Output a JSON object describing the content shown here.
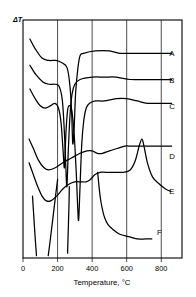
{
  "figure": {
    "type": "thermal-analysis-plot",
    "y_axis_label": "ΔT",
    "x_axis_label": "Temperature, °C",
    "x_ticks": [
      "0",
      "200",
      "400",
      "600",
      "800"
    ],
    "curve_labels": [
      "A",
      "B",
      "C",
      "D",
      "E",
      "F"
    ],
    "line_color": "#000000",
    "background_color": "#ffffff"
  },
  "chart_data": {
    "type": "line",
    "title": "",
    "xlabel": "Temperature, °C",
    "ylabel": "ΔT",
    "xlim": [
      0,
      920
    ],
    "ylim": [
      0,
      100
    ],
    "grid": true,
    "grid_axis": "x",
    "x_ticks": [
      0,
      200,
      400,
      600,
      800
    ],
    "legend": "right-side curve end labels",
    "series": [
      {
        "name": "A",
        "label": "A",
        "label_x": 840,
        "label_y": 86,
        "points": [
          [
            40,
            92
          ],
          [
            70,
            88
          ],
          [
            110,
            84
          ],
          [
            150,
            83
          ],
          [
            190,
            83
          ],
          [
            225,
            82
          ],
          [
            255,
            80
          ],
          [
            272,
            72
          ],
          [
            282,
            60
          ],
          [
            288,
            48
          ],
          [
            296,
            55
          ],
          [
            305,
            70
          ],
          [
            318,
            80
          ],
          [
            330,
            85
          ],
          [
            350,
            86
          ],
          [
            420,
            87
          ],
          [
            500,
            87
          ],
          [
            560,
            86
          ],
          [
            640,
            86
          ],
          [
            720,
            86
          ],
          [
            800,
            86
          ],
          [
            860,
            86
          ]
        ]
      },
      {
        "name": "B",
        "label": "B",
        "label_x": 840,
        "label_y": 75,
        "points": [
          [
            40,
            81
          ],
          [
            75,
            77
          ],
          [
            115,
            74
          ],
          [
            150,
            73
          ],
          [
            185,
            73
          ],
          [
            210,
            72
          ],
          [
            228,
            66
          ],
          [
            240,
            52
          ],
          [
            248,
            38
          ],
          [
            254,
            30
          ],
          [
            262,
            45
          ],
          [
            272,
            60
          ],
          [
            284,
            69
          ],
          [
            300,
            73
          ],
          [
            330,
            75
          ],
          [
            400,
            76
          ],
          [
            470,
            76
          ],
          [
            540,
            76
          ],
          [
            620,
            75
          ],
          [
            700,
            75
          ],
          [
            790,
            75
          ],
          [
            860,
            75
          ]
        ]
      },
      {
        "name": "C",
        "label": "C",
        "label_x": 840,
        "label_y": 64,
        "points": [
          [
            40,
            71
          ],
          [
            70,
            67
          ],
          [
            100,
            64
          ],
          [
            130,
            63
          ],
          [
            160,
            64
          ],
          [
            185,
            65
          ],
          [
            205,
            63
          ],
          [
            220,
            57
          ],
          [
            232,
            45
          ],
          [
            240,
            38
          ],
          [
            248,
            52
          ],
          [
            258,
            62
          ],
          [
            268,
            64
          ],
          [
            282,
            62
          ],
          [
            296,
            52
          ],
          [
            308,
            36
          ],
          [
            316,
            22
          ],
          [
            322,
            16
          ],
          [
            330,
            30
          ],
          [
            340,
            48
          ],
          [
            352,
            58
          ],
          [
            366,
            63
          ],
          [
            385,
            65
          ],
          [
            420,
            66
          ],
          [
            470,
            66
          ],
          [
            540,
            67
          ],
          [
            600,
            67
          ],
          [
            660,
            66
          ],
          [
            720,
            65
          ],
          [
            790,
            65
          ],
          [
            860,
            65
          ]
        ]
      },
      {
        "name": "D",
        "label": "D",
        "label_x": 840,
        "label_y": 43,
        "points": [
          [
            35,
            50
          ],
          [
            60,
            46
          ],
          [
            90,
            41
          ],
          [
            120,
            38
          ],
          [
            150,
            37
          ],
          [
            190,
            38
          ],
          [
            230,
            40
          ],
          [
            280,
            42
          ],
          [
            330,
            44
          ],
          [
            370,
            45
          ],
          [
            400,
            45
          ],
          [
            430,
            44
          ],
          [
            460,
            44
          ],
          [
            500,
            45
          ],
          [
            545,
            46
          ],
          [
            590,
            47
          ],
          [
            630,
            47
          ],
          [
            690,
            47
          ],
          [
            760,
            47
          ],
          [
            820,
            47
          ],
          [
            860,
            47
          ]
        ]
      },
      {
        "name": "E",
        "label": "E",
        "label_x": 840,
        "label_y": 28,
        "points": [
          [
            35,
            40
          ],
          [
            60,
            35
          ],
          [
            85,
            30
          ],
          [
            110,
            26
          ],
          [
            135,
            24
          ],
          [
            160,
            24
          ],
          [
            195,
            26
          ],
          [
            230,
            29
          ],
          [
            265,
            31
          ],
          [
            300,
            32
          ],
          [
            335,
            32
          ],
          [
            365,
            32
          ],
          [
            390,
            33
          ],
          [
            415,
            35
          ],
          [
            445,
            36
          ],
          [
            480,
            36
          ],
          [
            530,
            36
          ],
          [
            580,
            36
          ],
          [
            620,
            37
          ],
          [
            650,
            41
          ],
          [
            672,
            47
          ],
          [
            688,
            50
          ],
          [
            700,
            47
          ],
          [
            720,
            40
          ],
          [
            750,
            34
          ],
          [
            790,
            31
          ],
          [
            825,
            29
          ],
          [
            855,
            28
          ]
        ]
      },
      {
        "name": "F",
        "label": "F",
        "label_x": 770,
        "label_y": 11,
        "points": [
          [
            432,
            36
          ],
          [
            440,
            30
          ],
          [
            448,
            25
          ],
          [
            458,
            21
          ],
          [
            472,
            17
          ],
          [
            492,
            14
          ],
          [
            520,
            12
          ],
          [
            560,
            10
          ],
          [
            610,
            9
          ],
          [
            660,
            8
          ],
          [
            710,
            8
          ],
          [
            745,
            8
          ]
        ]
      },
      {
        "name": "F-left-tail-1",
        "label": "",
        "points": [
          [
            55,
            26
          ],
          [
            62,
            18
          ],
          [
            70,
            9
          ],
          [
            78,
            1
          ]
        ]
      },
      {
        "name": "F-left-tail-2",
        "label": "",
        "points": [
          [
            200,
            33
          ],
          [
            185,
            24
          ],
          [
            170,
            15
          ],
          [
            155,
            6
          ],
          [
            146,
            1
          ]
        ]
      },
      {
        "name": "F-left-tail-3",
        "label": "",
        "points": [
          [
            268,
            30
          ],
          [
            266,
            22
          ],
          [
            262,
            12
          ],
          [
            258,
            2
          ]
        ]
      }
    ]
  }
}
